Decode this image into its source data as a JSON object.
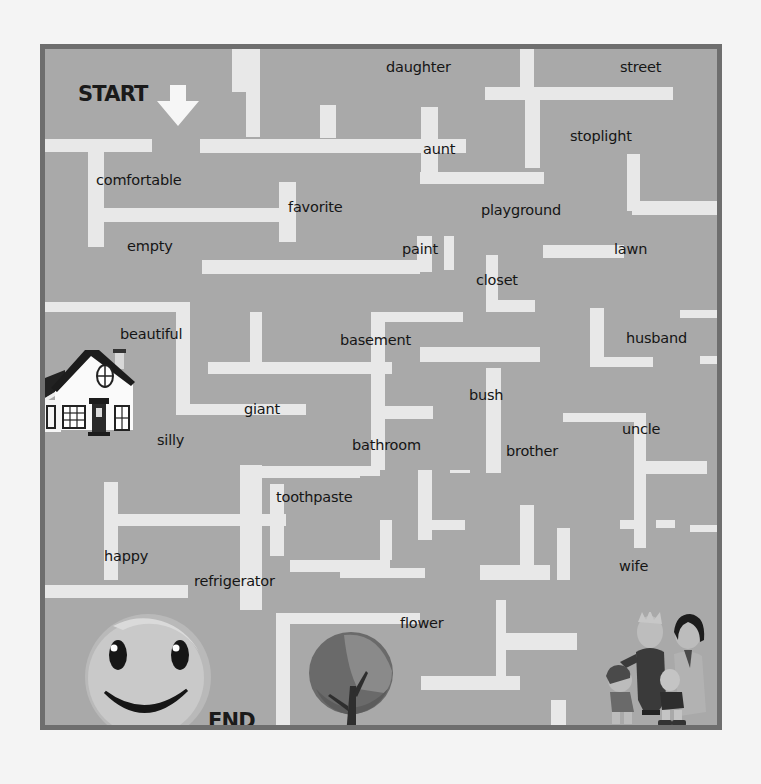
{
  "worksheet": {
    "title": "Word Maze",
    "start_label": "START",
    "end_label": "END",
    "colors": {
      "maze_background": "#a9a9a9",
      "maze_border": "#6e6e6e",
      "wall": "#e8e8e8",
      "text": "#151515",
      "page": "#f4f4f4"
    }
  },
  "words": [
    {
      "id": "daughter",
      "text": "daughter",
      "x": 386,
      "y": 59
    },
    {
      "id": "street",
      "text": "street",
      "x": 620,
      "y": 59
    },
    {
      "id": "stoplight",
      "text": "stoplight",
      "x": 570,
      "y": 128
    },
    {
      "id": "aunt",
      "text": "aunt",
      "x": 423,
      "y": 141
    },
    {
      "id": "comfortable",
      "text": "comfortable",
      "x": 96,
      "y": 172
    },
    {
      "id": "favorite",
      "text": "favorite",
      "x": 288,
      "y": 199
    },
    {
      "id": "playground",
      "text": "playground",
      "x": 481,
      "y": 202
    },
    {
      "id": "empty",
      "text": "empty",
      "x": 127,
      "y": 238
    },
    {
      "id": "paint",
      "text": "paint",
      "x": 402,
      "y": 241
    },
    {
      "id": "lawn",
      "text": "lawn",
      "x": 614,
      "y": 241
    },
    {
      "id": "closet",
      "text": "closet",
      "x": 476,
      "y": 272
    },
    {
      "id": "beautiful",
      "text": "beautiful",
      "x": 120,
      "y": 326
    },
    {
      "id": "basement",
      "text": "basement",
      "x": 340,
      "y": 332
    },
    {
      "id": "husband",
      "text": "husband",
      "x": 626,
      "y": 330
    },
    {
      "id": "bush",
      "text": "bush",
      "x": 469,
      "y": 387
    },
    {
      "id": "giant",
      "text": "giant",
      "x": 244,
      "y": 401
    },
    {
      "id": "uncle",
      "text": "uncle",
      "x": 622,
      "y": 421
    },
    {
      "id": "silly",
      "text": "silly",
      "x": 157,
      "y": 432
    },
    {
      "id": "bathroom",
      "text": "bathroom",
      "x": 352,
      "y": 437
    },
    {
      "id": "brother",
      "text": "brother",
      "x": 506,
      "y": 443
    },
    {
      "id": "toothpaste",
      "text": "toothpaste",
      "x": 276,
      "y": 489
    },
    {
      "id": "happy",
      "text": "happy",
      "x": 104,
      "y": 548
    },
    {
      "id": "refrigerator",
      "text": "refrigerator",
      "x": 194,
      "y": 573
    },
    {
      "id": "wife",
      "text": "wife",
      "x": 619,
      "y": 558
    },
    {
      "id": "flower",
      "text": "flower",
      "x": 400,
      "y": 615
    }
  ],
  "illustrations": {
    "house": "house-illustration",
    "smiley": "smiley-face-end",
    "tree": "tree-illustration",
    "family": "family-illustration",
    "arrow": "down-arrow-start"
  }
}
